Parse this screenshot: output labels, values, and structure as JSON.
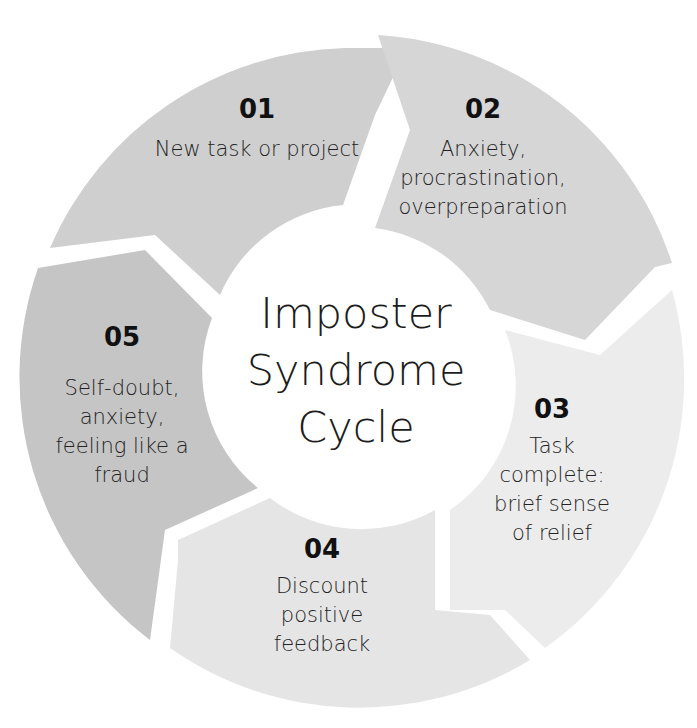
{
  "diagram": {
    "type": "cycle",
    "center_title": "Imposter\nSyndrome\nCycle",
    "steps": [
      {
        "number": "01",
        "text": "New task or project",
        "color": "#cfcfcf"
      },
      {
        "number": "02",
        "text": "Anxiety,\nprocrastination,\noverpreparation",
        "color": "#d6d6d6"
      },
      {
        "number": "03",
        "text": "Task\ncomplete:\nbrief sense\nof relief",
        "color": "#ececec"
      },
      {
        "number": "04",
        "text": "Discount\npositive\nfeedback",
        "color": "#e5e5e5"
      },
      {
        "number": "05",
        "text": "Self-doubt,\nanxiety,\nfeeling like a\nfraud",
        "color": "#c5c5c5"
      }
    ]
  }
}
